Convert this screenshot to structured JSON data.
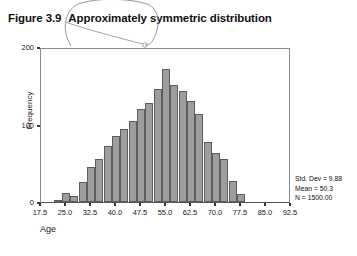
{
  "caption": {
    "figure_number": "Figure 3.9",
    "title": "Approximately symmetric distribution"
  },
  "annotation": {
    "type": "hand-drawn-oval-scribble",
    "color": "#7a7a86"
  },
  "stats": {
    "std_dev": "Std. Dev = 9.88",
    "mean": "Mean = 50.3",
    "n": "N = 1500.00"
  },
  "colors": {
    "bar_fill": "#9d9d9d",
    "bar_stroke": "#5d5d5d",
    "axis": "#55555c",
    "text": "#1a1a1a"
  },
  "chart_data": {
    "type": "bar",
    "title": "Approximately symmetric distribution",
    "xlabel": "Age",
    "ylabel": "Frequency",
    "xlim": [
      17.5,
      92.5
    ],
    "ylim": [
      0,
      200
    ],
    "grid": false,
    "legend": null,
    "bin_width": 2.5,
    "y_ticks": [
      0,
      100,
      200
    ],
    "x_ticks": [
      17.5,
      25.0,
      32.5,
      40.0,
      47.5,
      55.0,
      62.5,
      70.0,
      77.5,
      85.0,
      92.5
    ],
    "categories": [
      "22.5",
      "25.0",
      "27.5",
      "30.0",
      "32.5",
      "35.0",
      "37.5",
      "40.0",
      "42.5",
      "45.0",
      "47.5",
      "50.0",
      "52.5",
      "55.0",
      "57.5",
      "60.0",
      "62.5",
      "65.0",
      "67.5",
      "70.0",
      "72.5",
      "75.0",
      "77.5"
    ],
    "values": [
      3,
      11,
      8,
      26,
      45,
      56,
      72,
      85,
      94,
      104,
      120,
      128,
      146,
      171,
      151,
      143,
      130,
      114,
      78,
      63,
      56,
      27,
      10
    ],
    "annotations": [
      "Std. Dev = 9.88",
      "Mean = 50.3",
      "N = 1500.00"
    ]
  }
}
